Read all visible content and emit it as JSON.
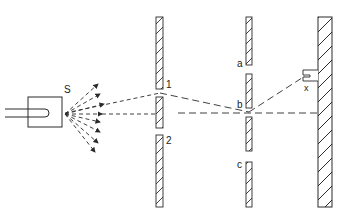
{
  "diagram": {
    "colors": {
      "ink": "#2a2a2a",
      "background": "#ffffff"
    },
    "source": {
      "label": "S"
    },
    "first_wall": {
      "slit_labels": [
        "1",
        "2"
      ]
    },
    "second_wall": {
      "hole_labels": [
        "a",
        "b",
        "c"
      ]
    },
    "detector": {
      "label": "x"
    }
  }
}
